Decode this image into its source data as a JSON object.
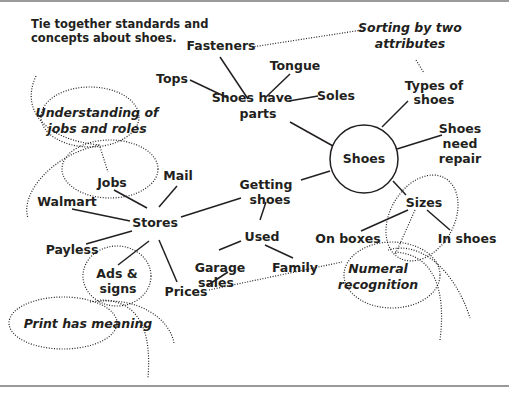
{
  "header": {
    "instruction_line1": "Tie together standards and",
    "instruction_line2": "concepts about shoes."
  },
  "center": {
    "label": "Shoes"
  },
  "nodes": {
    "shoes_have_parts": {
      "line1": "Shoes have",
      "line2": "parts"
    },
    "fasteners": "Fasteners",
    "tongue": "Tongue",
    "tops": "Tops",
    "soles": "Soles",
    "types_of_shoes": {
      "line1": "Types of",
      "line2": "shoes"
    },
    "shoes_need_repair": {
      "line1": "Shoes",
      "line2": "need",
      "line3": "repair"
    },
    "sizes": "Sizes",
    "on_boxes": "On boxes",
    "in_shoes": "In shoes",
    "getting_shoes": {
      "line1": "Getting",
      "line2": "shoes"
    },
    "used": "Used",
    "garage_sales": {
      "line1": "Garage",
      "line2": "sales"
    },
    "family": "Family",
    "stores": "Stores",
    "mail": "Mail",
    "jobs": "Jobs",
    "walmart": "Walmart",
    "payless": "Payless",
    "ads_signs": {
      "line1": "Ads &",
      "line2": "signs"
    },
    "prices": "Prices"
  },
  "standards": {
    "sorting": {
      "line1": "Sorting by two",
      "line2": "attributes"
    },
    "jobs_roles": {
      "line1": "Understanding of",
      "line2": "jobs and roles"
    },
    "print_meaning": "Print has meaning",
    "numeral": {
      "line1": "Numeral",
      "line2": "recognition"
    }
  }
}
